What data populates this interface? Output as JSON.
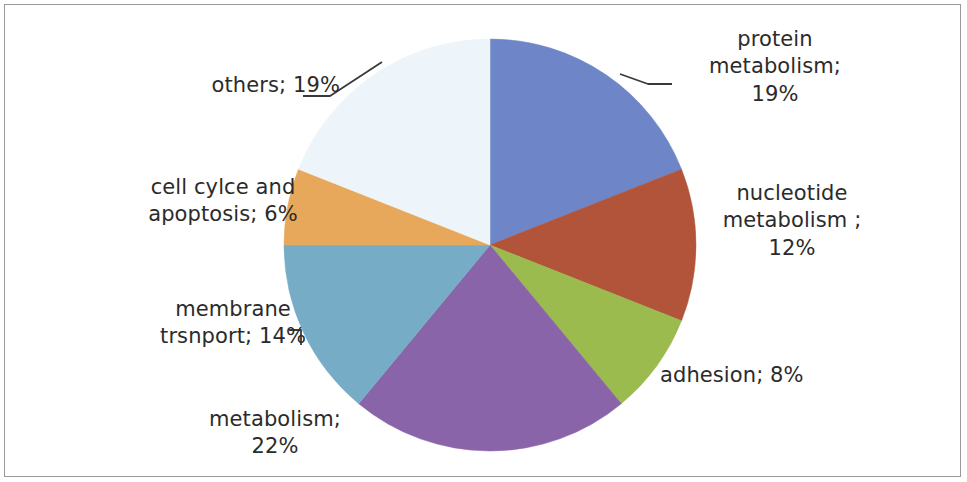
{
  "chart_data": {
    "type": "pie",
    "title": "",
    "subtitle": "",
    "xlabel": "",
    "ylabel": "",
    "legend_position": "none",
    "label_format": "category; value%",
    "start_angle_deg": 0,
    "direction": "clockwise",
    "categories": [
      "protein metabolism",
      "nucleotide metabolism ",
      "adhesion",
      "metabolism",
      "membrane trsnport",
      "cell cylce and apoptosis",
      "others"
    ],
    "values": [
      19,
      12,
      8,
      22,
      14,
      6,
      19
    ],
    "units": "%",
    "colors": [
      "#6E86C8",
      "#B1543A",
      "#9BBB4F",
      "#8A64A8",
      "#77ACC6",
      "#E8A85C",
      "#EDF5FA"
    ],
    "slices": [
      {
        "label": "protein metabolism",
        "value": 19,
        "color": "#6E86C8",
        "label_text": "protein\nmetabolism;\n19%",
        "leader_line": true
      },
      {
        "label": "nucleotide metabolism ",
        "value": 12,
        "color": "#B1543A",
        "label_text": "nucleotide\nmetabolism ;\n12%",
        "leader_line": false
      },
      {
        "label": "adhesion",
        "value": 8,
        "color": "#9BBB4F",
        "label_text": "adhesion; 8%",
        "leader_line": false
      },
      {
        "label": "metabolism",
        "value": 22,
        "color": "#8A64A8",
        "label_text": "metabolism;\n22%",
        "leader_line": false
      },
      {
        "label": "membrane trsnport",
        "value": 14,
        "color": "#77ACC6",
        "label_text": "membrane\ntrsnport; 14%",
        "leader_line": true
      },
      {
        "label": "cell cylce and apoptosis",
        "value": 6,
        "color": "#E8A85C",
        "label_text": "cell cylce and\napoptosis; 6%",
        "leader_line": false
      },
      {
        "label": "others",
        "value": 19,
        "color": "#EDF5FA",
        "label_text": "others; 19%",
        "leader_line": true
      }
    ],
    "total": 100,
    "geometry": {
      "center_x": 490,
      "center_y": 245,
      "radius": 206
    },
    "border_color": "#9a9a9a",
    "background_color": "#ffffff",
    "text_color": "#2b2b2b"
  }
}
